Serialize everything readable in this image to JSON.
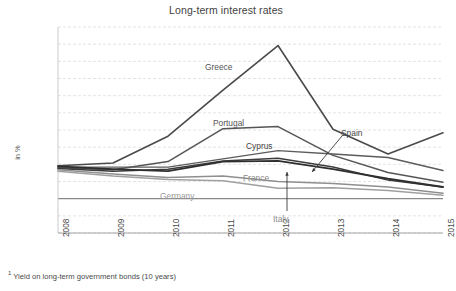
{
  "chart_data": {
    "type": "line",
    "title": "Long-term interest rates",
    "xlabel": "",
    "ylabel": "in %",
    "x": [
      2008,
      2009,
      2010,
      2011,
      2012,
      2013,
      2014,
      2015
    ],
    "categories": [
      "2008",
      "2009",
      "2010",
      "2011",
      "2012",
      "2013",
      "2014",
      "2015"
    ],
    "ylim": [
      -5.0,
      25.0
    ],
    "yticks": [
      25.0,
      22.5,
      20.0,
      17.5,
      15.0,
      12.5,
      10.0,
      7.5,
      5.0,
      2.5,
      0.0,
      -2.5,
      -5.0
    ],
    "ytick_labels": [
      "25.0",
      "22.5",
      "20.0",
      "17.5",
      "15.0",
      "12.5",
      "10.0",
      "7.5",
      "5.0",
      "2.5",
      "0.0",
      "-2.5",
      "-5.0"
    ],
    "grid": true,
    "legend": "inline-labels",
    "footnote": "Yield on long-term government bonds (10 years)",
    "footnote_marker": "1",
    "series": [
      {
        "name": "Greece",
        "values": [
          4.8,
          5.2,
          9.1,
          15.8,
          22.3,
          10.1,
          6.5,
          9.6
        ],
        "color": "#4a4a4a",
        "width": 1.6
      },
      {
        "name": "Portugal",
        "values": [
          4.5,
          4.2,
          5.4,
          10.2,
          10.5,
          6.3,
          3.8,
          2.4
        ],
        "color": "#555555",
        "width": 1.5
      },
      {
        "name": "Cyprus",
        "values": [
          4.6,
          4.6,
          4.6,
          5.8,
          7.0,
          6.5,
          6.0,
          4.1
        ],
        "color": "#5c5c5c",
        "width": 1.4
      },
      {
        "name": "Spain",
        "values": [
          4.4,
          4.0,
          4.3,
          5.5,
          5.9,
          4.6,
          2.7,
          1.7
        ],
        "color": "#3c3c3c",
        "width": 1.5
      },
      {
        "name": "Italy",
        "values": [
          4.7,
          4.3,
          4.0,
          5.4,
          5.5,
          4.3,
          2.9,
          1.7
        ],
        "color": "#2f2f2f",
        "width": 1.8
      },
      {
        "name": "France",
        "values": [
          4.2,
          3.6,
          3.1,
          3.3,
          2.5,
          2.2,
          1.7,
          0.8
        ],
        "color": "#8f8f8f",
        "width": 1.5
      },
      {
        "name": "Germany",
        "values": [
          4.0,
          3.3,
          2.8,
          2.6,
          1.5,
          1.6,
          1.2,
          0.5
        ],
        "color": "#a0a0a0",
        "width": 1.5
      }
    ],
    "annotations": [
      {
        "name": "Greece",
        "label": "Greece",
        "x": 205,
        "y": 63,
        "color": "#555555"
      },
      {
        "name": "Portugal",
        "label": "Portugal",
        "x": 213,
        "y": 119,
        "color": "#555555"
      },
      {
        "name": "Cyprus",
        "label": "Cyprus",
        "x": 246,
        "y": 142,
        "color": "#3f3f3f"
      },
      {
        "name": "Spain",
        "label": "Spain",
        "x": 341,
        "y": 129,
        "color": "#3f3f3f"
      },
      {
        "name": "France",
        "label": "France",
        "x": 243,
        "y": 174,
        "color": "#8a8a8a"
      },
      {
        "name": "Germany",
        "label": "Germany",
        "x": 160,
        "y": 192,
        "color": "#9a9a9a"
      },
      {
        "name": "Italy",
        "label": "Italy",
        "x": 273,
        "y": 215,
        "color": "#8a8a8a"
      }
    ]
  }
}
